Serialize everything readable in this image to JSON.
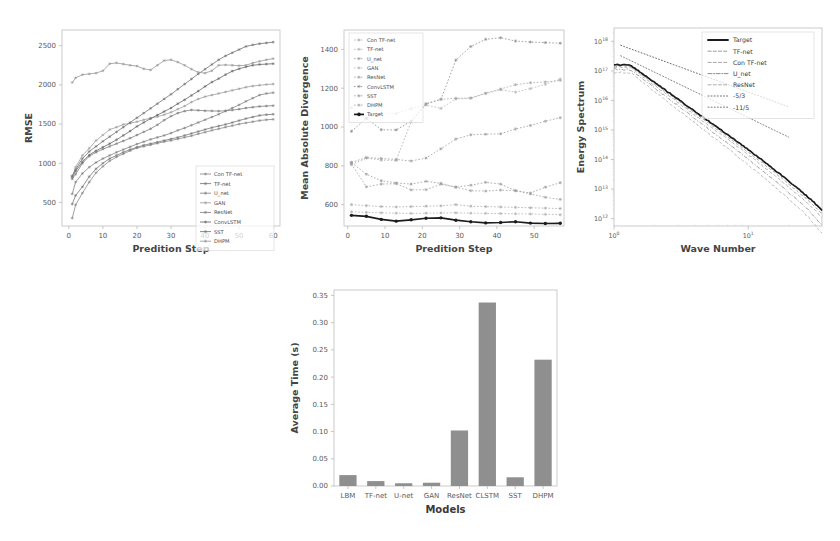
{
  "figure": {
    "panels": [
      "rmse",
      "divergence",
      "spectrum",
      "runtime"
    ]
  },
  "chart_data": [
    {
      "id": "rmse",
      "type": "line",
      "title": "",
      "xlabel": "Predition Step",
      "ylabel": "RMSE",
      "xticks": [
        0,
        10,
        20,
        30,
        40,
        50,
        60
      ],
      "yticks": [
        500,
        1000,
        1500,
        2000,
        2500
      ],
      "xlim": [
        -2,
        62
      ],
      "ylim": [
        200,
        2700
      ],
      "grid": false,
      "legend_position": "lower-right",
      "x": [
        1,
        2,
        4,
        6,
        8,
        10,
        12,
        14,
        16,
        18,
        20,
        22,
        24,
        26,
        28,
        30,
        32,
        34,
        36,
        38,
        40,
        42,
        44,
        46,
        48,
        50,
        52,
        54,
        56,
        58,
        60
      ],
      "series": [
        {
          "name": "Con TF-net",
          "color": "#8f8f8f",
          "values": [
            300,
            470,
            620,
            760,
            880,
            960,
            1030,
            1080,
            1120,
            1160,
            1195,
            1215,
            1235,
            1255,
            1275,
            1290,
            1310,
            1330,
            1350,
            1375,
            1395,
            1420,
            1440,
            1460,
            1480,
            1500,
            1515,
            1530,
            1545,
            1555,
            1560
          ]
        },
        {
          "name": "TF-net",
          "color": "#7e7e7e",
          "values": [
            480,
            590,
            700,
            830,
            930,
            1000,
            1060,
            1100,
            1140,
            1175,
            1205,
            1230,
            1250,
            1270,
            1290,
            1310,
            1330,
            1355,
            1380,
            1405,
            1430,
            1455,
            1475,
            1495,
            1520,
            1545,
            1570,
            1590,
            1610,
            1620,
            1625
          ]
        },
        {
          "name": "U_net",
          "color": "#8a8a8a",
          "values": [
            610,
            760,
            870,
            950,
            1010,
            1060,
            1100,
            1140,
            1175,
            1210,
            1245,
            1275,
            1305,
            1330,
            1355,
            1385,
            1420,
            1450,
            1485,
            1520,
            1555,
            1590,
            1625,
            1665,
            1705,
            1745,
            1790,
            1830,
            1870,
            1890,
            1900
          ]
        },
        {
          "name": "GAN",
          "color": "#a3a3a3",
          "values": [
            820,
            950,
            1100,
            1190,
            1290,
            1360,
            1430,
            1460,
            1495,
            1510,
            1530,
            1555,
            1575,
            1595,
            1620,
            1650,
            1690,
            1730,
            1780,
            1820,
            1850,
            1870,
            1890,
            1910,
            1930,
            1950,
            1970,
            1985,
            1995,
            2005,
            2010
          ]
        },
        {
          "name": "ResNet",
          "color": "#858585",
          "values": [
            800,
            860,
            1000,
            1090,
            1140,
            1180,
            1215,
            1250,
            1285,
            1320,
            1360,
            1400,
            1440,
            1490,
            1550,
            1600,
            1640,
            1665,
            1680,
            1675,
            1670,
            1668,
            1665,
            1670,
            1678,
            1690,
            1705,
            1715,
            1725,
            1730,
            1735
          ]
        },
        {
          "name": "ConvLSTM",
          "color": "#6f6f6f",
          "values": [
            830,
            900,
            1020,
            1105,
            1160,
            1205,
            1250,
            1300,
            1355,
            1410,
            1470,
            1520,
            1570,
            1615,
            1660,
            1705,
            1760,
            1810,
            1865,
            1920,
            1980,
            2035,
            2080,
            2130,
            2175,
            2205,
            2230,
            2250,
            2260,
            2265,
            2270
          ]
        },
        {
          "name": "SST",
          "color": "#7a7a7a",
          "values": [
            840,
            920,
            1060,
            1150,
            1215,
            1280,
            1340,
            1400,
            1460,
            1520,
            1580,
            1640,
            1700,
            1760,
            1820,
            1880,
            1945,
            2010,
            2075,
            2140,
            2200,
            2260,
            2320,
            2370,
            2410,
            2450,
            2490,
            2510,
            2525,
            2535,
            2545
          ]
        },
        {
          "name": "DHPM",
          "color": "#9e9e9e",
          "values": [
            2030,
            2090,
            2130,
            2140,
            2150,
            2180,
            2270,
            2280,
            2265,
            2250,
            2240,
            2205,
            2190,
            2250,
            2310,
            2320,
            2290,
            2250,
            2200,
            2160,
            2150,
            2180,
            2250,
            2255,
            2250,
            2245,
            2250,
            2280,
            2300,
            2320,
            2335
          ]
        }
      ]
    },
    {
      "id": "divergence",
      "type": "line",
      "title": "",
      "xlabel": "Predition Step",
      "ylabel": "Mean Absolute Divergence",
      "xticks": [
        0,
        10,
        20,
        30,
        40,
        50
      ],
      "yticks": [
        600,
        800,
        1000,
        1200,
        1400
      ],
      "xlim": [
        -1,
        58
      ],
      "ylim": [
        490,
        1500
      ],
      "grid": false,
      "legend_position": "upper-left",
      "x": [
        1,
        5,
        9,
        13,
        17,
        21,
        25,
        29,
        33,
        37,
        41,
        45,
        49,
        53,
        57
      ],
      "series": [
        {
          "name": "Con TF-net",
          "color": "#a9a9a9",
          "values": [
            600,
            595,
            590,
            588,
            590,
            592,
            594,
            600,
            592,
            590,
            588,
            586,
            584,
            582,
            580
          ]
        },
        {
          "name": "TF-net",
          "color": "#b0b0b0",
          "values": [
            563,
            560,
            558,
            556,
            555,
            556,
            557,
            558,
            556,
            555,
            554,
            553,
            552,
            550,
            548
          ]
        },
        {
          "name": "U_net",
          "color": "#9a9a9a",
          "values": [
            817,
            757,
            723,
            712,
            706,
            720,
            710,
            690,
            700,
            715,
            706,
            672,
            660,
            690,
            713
          ]
        },
        {
          "name": "GAN",
          "color": "#b4b4b4",
          "values": [
            1100,
            1046,
            1071,
            1070,
            1095,
            1113,
            1096,
            1145,
            1148,
            1172,
            1192,
            1180,
            1198,
            1220,
            1247
          ]
        },
        {
          "name": "ResNet",
          "color": "#a0a0a0",
          "values": [
            810,
            692,
            706,
            708,
            676,
            677,
            705,
            690,
            672,
            670,
            675,
            672,
            655,
            638,
            627
          ]
        },
        {
          "name": "ConvLSTM",
          "color": "#8c8c8c",
          "values": [
            978,
            1045,
            986,
            985,
            1030,
            1120,
            1143,
            1345,
            1415,
            1452,
            1460,
            1443,
            1438,
            1435,
            1432
          ]
        },
        {
          "name": "SST",
          "color": "#9c9c9c",
          "values": [
            818,
            843,
            838,
            833,
            825,
            840,
            888,
            938,
            960,
            963,
            965,
            990,
            1008,
            1030,
            1048
          ]
        },
        {
          "name": "DHPM",
          "color": "#a6a6a6",
          "values": [
            806,
            840,
            830,
            828,
            1028,
            1118,
            1143,
            1148,
            1150,
            1175,
            1196,
            1218,
            1228,
            1232,
            1240
          ]
        },
        {
          "name": "Target",
          "color": "#1c1c1c",
          "values": [
            545,
            540,
            524,
            515,
            522,
            530,
            532,
            520,
            512,
            506,
            508,
            512,
            505,
            503,
            504
          ]
        }
      ]
    },
    {
      "id": "spectrum",
      "type": "line",
      "title": "",
      "xlabel": "Wave Number",
      "ylabel": "Energy Spectrum",
      "xscale": "log",
      "yscale": "log",
      "xticks": [
        "10⁰",
        "10¹"
      ],
      "yticks": [
        "10¹⁸",
        "10¹⁷",
        "10¹⁶",
        "10¹⁵",
        "10¹⁴",
        "10¹³",
        "10¹²"
      ],
      "grid": false,
      "legend_position": "upper-right",
      "legend": [
        "Target",
        "TF-net",
        "Con TF-net",
        "U_net",
        "ResNet",
        "-5/3",
        "-11/5"
      ],
      "series": [
        {
          "name": "Target",
          "color": "#1c1c1c",
          "style": "solid"
        },
        {
          "name": "TF-net",
          "color": "#9a9a9a",
          "style": "dashed"
        },
        {
          "name": "Con TF-net",
          "color": "#a8a8a8",
          "style": "dashed"
        },
        {
          "name": "U_net",
          "color": "#8e8e8e",
          "style": "dashdot"
        },
        {
          "name": "ResNet",
          "color": "#b0b0b0",
          "style": "dashed"
        },
        {
          "name": "-5/3",
          "color": "#6e6e6e",
          "style": "dotted"
        },
        {
          "name": "-11/5",
          "color": "#7a7a7a",
          "style": "dotted"
        }
      ]
    },
    {
      "id": "runtime",
      "type": "bar",
      "title": "",
      "xlabel": "Models",
      "ylabel": "Average Time (s)",
      "categories": [
        "LBM",
        "TF-net",
        "U-net",
        "GAN",
        "ResNet",
        "CLSTM",
        "SST",
        "DHPM"
      ],
      "values": [
        0.02,
        0.009,
        0.005,
        0.006,
        0.102,
        0.337,
        0.016,
        0.232
      ],
      "yticks": [
        0.0,
        0.05,
        0.1,
        0.15,
        0.2,
        0.25,
        0.3,
        0.35
      ],
      "ytick_labels": [
        "0.00",
        "0.05",
        "0.10",
        "0.15",
        "0.20",
        "0.25",
        "0.30",
        "0.35"
      ],
      "ylim": [
        0,
        0.36
      ],
      "grid": false,
      "bar_color": "#8f8f8f"
    }
  ]
}
